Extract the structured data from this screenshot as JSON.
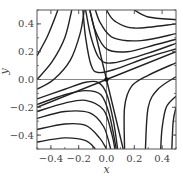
{
  "chart_data": {
    "type": "line",
    "title": "",
    "xlabel": "x",
    "ylabel": "y",
    "xlim": [
      -0.5,
      0.5
    ],
    "ylim": [
      -0.5,
      0.5
    ],
    "grid": false,
    "legend": null,
    "x_ticks": [
      -0.4,
      -0.2,
      0.0,
      0.2,
      0.4
    ],
    "x_tick_labels": [
      "−0.4",
      "−0.2",
      "0.0",
      "0.2",
      "0.4"
    ],
    "y_ticks": [
      -0.4,
      -0.2,
      0.0,
      0.2,
      0.4
    ],
    "y_tick_labels": [
      "−0.4",
      "−0.2",
      "0.0",
      "0.2",
      "0.4"
    ],
    "reference_lines": [
      {
        "orientation": "horizontal",
        "value": 0.0,
        "color": "#888888"
      },
      {
        "orientation": "vertical",
        "value": 0.0,
        "color": "#888888"
      }
    ],
    "fixed_point": {
      "x": 0.0,
      "y": 0.0,
      "kind": "saddle"
    },
    "separatrices": [
      {
        "name": "stable",
        "points": [
          [
            -0.12,
            0.5
          ],
          [
            0.0,
            0.0
          ],
          [
            0.12,
            -0.5
          ]
        ]
      },
      {
        "name": "unstable",
        "points": [
          [
            -0.5,
            -0.2
          ],
          [
            0.0,
            0.0
          ],
          [
            0.5,
            0.2
          ]
        ]
      }
    ],
    "trajectories": [
      {
        "points": [
          [
            -0.5,
            0.17
          ],
          [
            -0.43,
            0.3
          ],
          [
            -0.38,
            0.42
          ],
          [
            -0.35,
            0.5
          ]
        ]
      },
      {
        "points": [
          [
            -0.5,
            0.0
          ],
          [
            -0.39,
            0.13
          ],
          [
            -0.3,
            0.3
          ],
          [
            -0.25,
            0.5
          ]
        ]
      },
      {
        "points": [
          [
            -0.5,
            -0.07
          ],
          [
            -0.38,
            0.0
          ],
          [
            -0.26,
            0.14
          ],
          [
            -0.19,
            0.33
          ],
          [
            -0.16,
            0.5
          ]
        ]
      },
      {
        "points": [
          [
            -0.17,
            0.5
          ],
          [
            -0.15,
            0.3
          ],
          [
            -0.11,
            0.1
          ],
          [
            -0.06,
            0.05
          ],
          [
            0.05,
            0.07
          ],
          [
            0.3,
            0.16
          ],
          [
            0.5,
            0.22
          ]
        ]
      },
      {
        "points": [
          [
            -0.15,
            0.5
          ],
          [
            -0.11,
            0.3
          ],
          [
            -0.05,
            0.15
          ],
          [
            0.05,
            0.12
          ],
          [
            0.3,
            0.19
          ],
          [
            0.5,
            0.26
          ]
        ]
      },
      {
        "points": [
          [
            -0.12,
            0.5
          ],
          [
            -0.08,
            0.35
          ],
          [
            0.0,
            0.22
          ],
          [
            0.15,
            0.2
          ],
          [
            0.35,
            0.25
          ],
          [
            0.5,
            0.29
          ]
        ]
      },
      {
        "points": [
          [
            -0.08,
            0.5
          ],
          [
            -0.04,
            0.4
          ],
          [
            0.05,
            0.3
          ],
          [
            0.25,
            0.28
          ],
          [
            0.5,
            0.33
          ]
        ]
      },
      {
        "points": [
          [
            0.0,
            0.5
          ],
          [
            0.06,
            0.42
          ],
          [
            0.2,
            0.37
          ],
          [
            0.5,
            0.4
          ]
        ]
      },
      {
        "points": [
          [
            0.2,
            0.5
          ],
          [
            0.3,
            0.45
          ],
          [
            0.5,
            0.43
          ]
        ]
      },
      {
        "points": [
          [
            -0.5,
            -0.14
          ],
          [
            -0.3,
            -0.07
          ],
          [
            -0.15,
            -0.02
          ],
          [
            -0.06,
            -0.02
          ],
          [
            0.0,
            -0.1
          ],
          [
            0.05,
            -0.3
          ],
          [
            0.08,
            -0.5
          ]
        ]
      },
      {
        "points": [
          [
            -0.5,
            -0.18
          ],
          [
            -0.3,
            -0.11
          ],
          [
            -0.15,
            -0.08
          ],
          [
            -0.04,
            -0.11
          ],
          [
            0.02,
            -0.25
          ],
          [
            0.07,
            -0.5
          ]
        ]
      },
      {
        "points": [
          [
            -0.5,
            -0.23
          ],
          [
            -0.3,
            -0.17
          ],
          [
            -0.15,
            -0.15
          ],
          [
            -0.02,
            -0.22
          ],
          [
            0.04,
            -0.4
          ],
          [
            0.06,
            -0.5
          ]
        ]
      },
      {
        "points": [
          [
            -0.5,
            -0.28
          ],
          [
            -0.3,
            -0.23
          ],
          [
            -0.12,
            -0.24
          ],
          [
            -0.02,
            -0.34
          ],
          [
            0.03,
            -0.5
          ]
        ]
      },
      {
        "points": [
          [
            -0.5,
            -0.36
          ],
          [
            -0.3,
            -0.32
          ],
          [
            -0.15,
            -0.33
          ],
          [
            -0.05,
            -0.42
          ],
          [
            0.0,
            -0.5
          ]
        ]
      },
      {
        "points": [
          [
            -0.5,
            -0.45
          ],
          [
            -0.3,
            -0.42
          ],
          [
            -0.15,
            -0.44
          ],
          [
            -0.08,
            -0.5
          ]
        ]
      },
      {
        "points": [
          [
            0.5,
            0.12
          ],
          [
            0.3,
            0.03
          ],
          [
            0.18,
            -0.05
          ],
          [
            0.13,
            -0.2
          ],
          [
            0.13,
            -0.5
          ]
        ]
      },
      {
        "points": [
          [
            0.5,
            0.02
          ],
          [
            0.37,
            -0.07
          ],
          [
            0.3,
            -0.2
          ],
          [
            0.28,
            -0.5
          ]
        ]
      },
      {
        "points": [
          [
            0.5,
            -0.12
          ],
          [
            0.43,
            -0.2
          ],
          [
            0.4,
            -0.35
          ],
          [
            0.39,
            -0.5
          ]
        ]
      },
      {
        "points": [
          [
            0.5,
            -0.2
          ],
          [
            0.48,
            -0.3
          ],
          [
            0.47,
            -0.5
          ]
        ]
      }
    ]
  }
}
